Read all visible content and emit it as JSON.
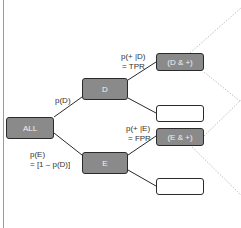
{
  "nodes": {
    "all": "ALL",
    "d": "D",
    "e": "E",
    "d_pos": "(D & +)",
    "d_neg": "",
    "e_pos": "(E & +)",
    "e_neg": ""
  },
  "edges": {
    "p_d": "p(D)",
    "p_e_line1": "p(E)",
    "p_e_line2": "= [1 – p(D)]",
    "tpr_line1": "p(+ |D)",
    "tpr_line2": "= TPR",
    "fpr_line1": "p(+ |E)",
    "fpr_line2": "= FPR"
  },
  "colors": {
    "filled_node": "#8a8a8a",
    "empty_node": "#ffffff",
    "line": "#2a2a2a",
    "dotted": "#b0b0b0"
  }
}
